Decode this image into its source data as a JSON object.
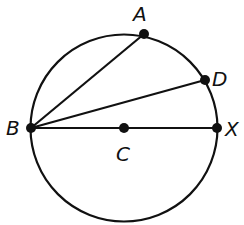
{
  "diagram": {
    "type": "circle-geometry",
    "circle": {
      "center": "C",
      "cx": 124,
      "cy": 128,
      "r": 93.5
    },
    "points": [
      {
        "id": "A",
        "label": "A",
        "x": 144,
        "y": 34,
        "label_x": 133,
        "label_y": 20
      },
      {
        "id": "D",
        "label": "D",
        "x": 205,
        "y": 80,
        "label_x": 212,
        "label_y": 86
      },
      {
        "id": "B",
        "label": "B",
        "x": 31,
        "y": 128,
        "label_x": 6,
        "label_y": 135
      },
      {
        "id": "C",
        "label": "C",
        "x": 124,
        "y": 128,
        "label_x": 116,
        "label_y": 160
      },
      {
        "id": "X",
        "label": "X",
        "x": 217,
        "y": 128,
        "label_x": 226,
        "label_y": 136
      }
    ],
    "segments": [
      {
        "from": "B",
        "to": "A"
      },
      {
        "from": "B",
        "to": "D"
      },
      {
        "from": "B",
        "to": "X"
      }
    ],
    "colors": {
      "stroke": "#111111",
      "background": "#ffffff"
    }
  }
}
